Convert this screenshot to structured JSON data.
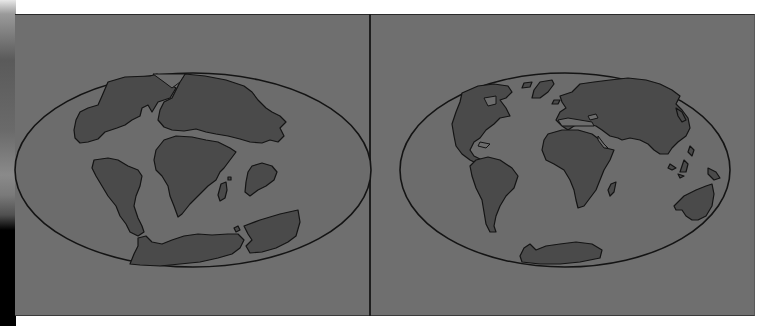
{
  "figure": {
    "panels": [
      {
        "id": "left",
        "subject": "Pangaea supercontinent (ancient continental arrangement)",
        "landmasses": [
          "north-america-block",
          "eurasia-block",
          "south-america",
          "africa",
          "madagascar",
          "india",
          "antarctica-australia-block"
        ]
      },
      {
        "id": "right",
        "subject": "Present-day continents",
        "landmasses": [
          "north-america",
          "greenland",
          "south-america",
          "europe-asia",
          "africa",
          "madagascar",
          "australia",
          "antarctica",
          "indonesia-islands"
        ]
      }
    ],
    "colors": {
      "background": "#6f6f6f",
      "ocean": "#6c6c6c",
      "land": "#4a4a4a",
      "outline": "#141414",
      "page": "#ffffff"
    }
  }
}
